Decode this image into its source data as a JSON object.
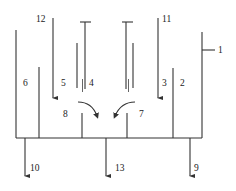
{
  "diagram": {
    "type": "schematic",
    "labels": {
      "l1": "1",
      "l2": "2",
      "l3": "3",
      "l4": "4",
      "l5": "5",
      "l6": "6",
      "l7": "7",
      "l8": "8",
      "l9": "9",
      "l10": "10",
      "l11": "11",
      "l12": "12",
      "l13": "13"
    },
    "colors": {
      "line": "#333333",
      "background": "#ffffff"
    }
  }
}
